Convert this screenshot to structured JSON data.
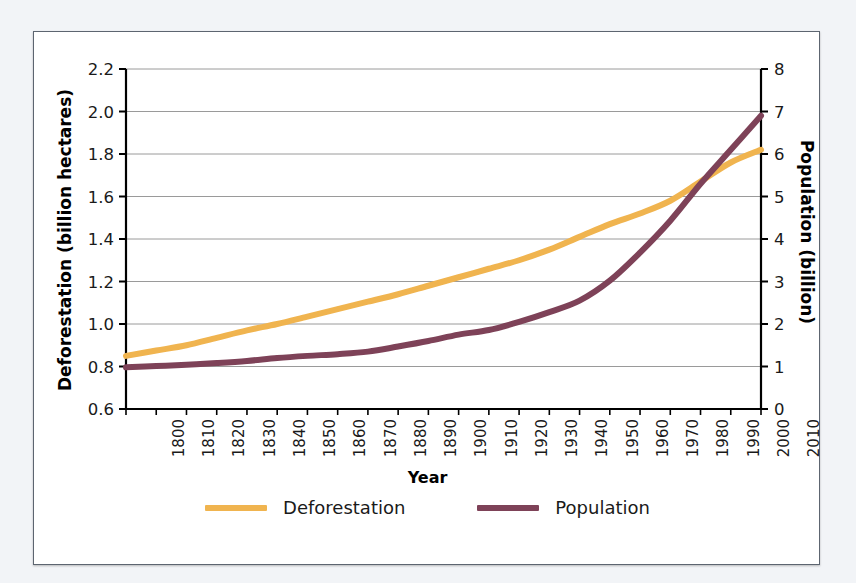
{
  "chart_data": {
    "type": "line",
    "title": "",
    "xlabel": "Year",
    "ylabel": "Deforestation (billion hectares)",
    "y2label": "Population (billion)",
    "grid": true,
    "legend_position": "bottom",
    "x": [
      1800,
      1810,
      1820,
      1830,
      1840,
      1850,
      1860,
      1870,
      1880,
      1890,
      1900,
      1910,
      1920,
      1930,
      1940,
      1950,
      1960,
      1970,
      1980,
      1990,
      2000,
      2010
    ],
    "xtick_labels": [
      "1800",
      "1810",
      "1820",
      "1830",
      "1840",
      "1850",
      "1860",
      "1870",
      "1880",
      "1890",
      "1900",
      "1910",
      "1920",
      "1930",
      "1940",
      "1950",
      "1960",
      "1970",
      "1980",
      "1990",
      "2000",
      "2010"
    ],
    "ylim": [
      0.6,
      2.2
    ],
    "ytick_labels": [
      "0.6",
      "0.8",
      "1.0",
      "1.2",
      "1.4",
      "1.6",
      "1.8",
      "2.0",
      "2.2"
    ],
    "ytick_values": [
      0.6,
      0.8,
      1.0,
      1.2,
      1.4,
      1.6,
      1.8,
      2.0,
      2.2
    ],
    "y2lim": [
      0,
      8
    ],
    "y2tick_labels": [
      "0",
      "1",
      "2",
      "3",
      "4",
      "5",
      "6",
      "7",
      "8"
    ],
    "y2tick_values": [
      0,
      1,
      2,
      3,
      4,
      5,
      6,
      7,
      8
    ],
    "series": [
      {
        "name": "Deforestation",
        "axis": "left",
        "units": "billion hectares",
        "color": "#f0b44f",
        "values": [
          0.85,
          0.875,
          0.9,
          0.935,
          0.97,
          1.0,
          1.035,
          1.07,
          1.105,
          1.14,
          1.18,
          1.22,
          1.26,
          1.3,
          1.35,
          1.41,
          1.47,
          1.52,
          1.58,
          1.67,
          1.76,
          1.82
        ]
      },
      {
        "name": "Population",
        "axis": "right",
        "units": "billion",
        "color": "#7e4258",
        "values": [
          0.98,
          1.01,
          1.04,
          1.08,
          1.13,
          1.2,
          1.25,
          1.29,
          1.35,
          1.47,
          1.6,
          1.75,
          1.86,
          2.05,
          2.28,
          2.55,
          3.02,
          3.68,
          4.43,
          5.3,
          6.1,
          6.9
        ]
      }
    ]
  },
  "legend": {
    "items": [
      {
        "label": "Deforestation",
        "color": "#f0b44f"
      },
      {
        "label": "Population",
        "color": "#7e4258"
      }
    ]
  }
}
